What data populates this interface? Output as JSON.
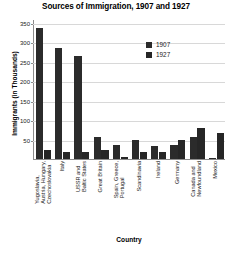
{
  "chart_data": {
    "type": "bar",
    "title": "Sources of Immigration, 1907 and 1927",
    "xlabel": "Country",
    "ylabel": "Immigrants (in Thousands)",
    "ylim": [
      0,
      360
    ],
    "yticks": [
      50,
      100,
      150,
      200,
      250,
      300,
      350
    ],
    "ytick_labels": [
      "50",
      "100",
      "150",
      "200",
      "250",
      "300",
      "350"
    ],
    "grid": true,
    "legend_position": "upper right",
    "categories": [
      "Yugoslavia, Austria, Hungary, Czechoslovakia",
      "Italy",
      "USSR and Baltic States",
      "Great Britain",
      "Spain, Greece, Portugal",
      "Scandinavia",
      "Ireland",
      "Germany",
      "Canada and Newfoundland",
      "Mexico"
    ],
    "category_lines": [
      [
        "Yugoslavia,",
        "Austria, Hungary,",
        "Czechoslovakia"
      ],
      [
        "Italy"
      ],
      [
        "USSR and",
        "Baltic States"
      ],
      [
        "Great Britain"
      ],
      [
        "Spain, Greece,",
        "Portugal"
      ],
      [
        "Scandinavia"
      ],
      [
        "Ireland"
      ],
      [
        "Germany"
      ],
      [
        "Canada and",
        "Newfoundland"
      ],
      [
        "Mexico"
      ]
    ],
    "series": [
      {
        "name": "1907",
        "color": "#2b2b2b",
        "values": [
          338,
          285,
          265,
          56,
          36,
          48,
          34,
          37,
          57,
          2
        ]
      },
      {
        "name": "1927",
        "color": "#262626",
        "values": [
          22,
          18,
          18,
          22,
          6,
          18,
          19,
          48,
          81,
          67
        ]
      }
    ]
  },
  "legend": {
    "items": [
      {
        "label": "1907",
        "color": "#2b2b2b"
      },
      {
        "label": "1927",
        "color": "#262626"
      }
    ]
  }
}
